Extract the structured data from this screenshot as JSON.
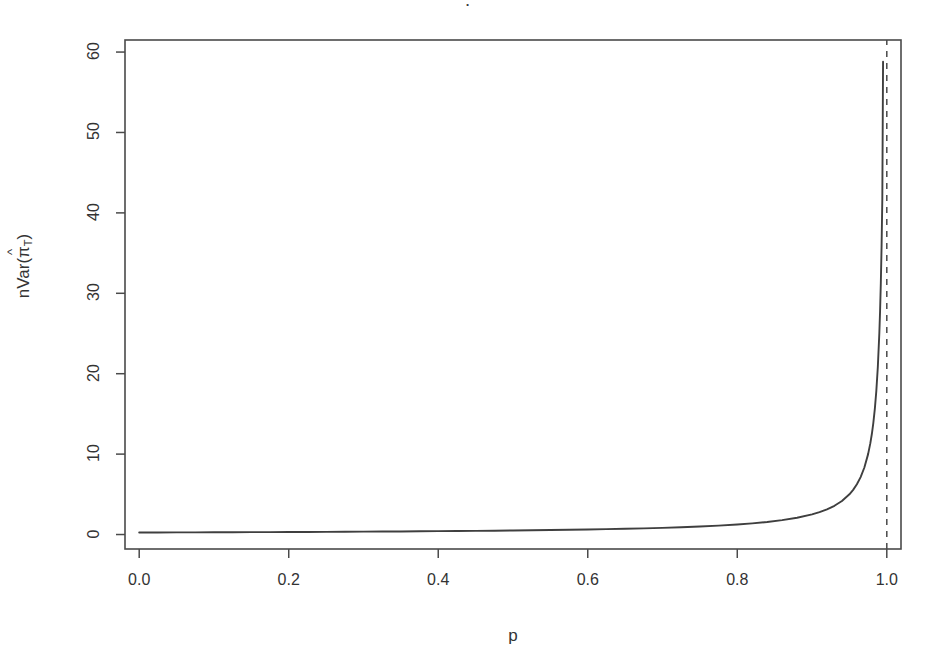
{
  "figure": {
    "title_remnant": "·",
    "background": "#ffffff",
    "line_color": "#3f3f3f",
    "axis_color": "#4a4a4a"
  },
  "axes": {
    "x_label": "p",
    "y_label_prefix": "nVar(",
    "y_label_symbol": "π",
    "y_label_hat": "^",
    "y_label_subscript": "T",
    "y_label_suffix": ")"
  },
  "chart_data": {
    "type": "line",
    "title": "",
    "xlabel": "p",
    "ylabel": "nVar(pi-hat_T)",
    "xlim": [
      -0.019,
      1.019
    ],
    "ylim": [
      -1.8,
      61.5
    ],
    "xticks": [
      0.0,
      0.2,
      0.4,
      0.6,
      0.8,
      1.0
    ],
    "xticklabels": [
      "0.0",
      "0.2",
      "0.4",
      "0.6",
      "0.8",
      "1.0"
    ],
    "yticks": [
      0,
      10,
      20,
      30,
      40,
      50,
      60
    ],
    "yticklabels": [
      "0",
      "10",
      "20",
      "30",
      "40",
      "50",
      "60"
    ],
    "grid": false,
    "legend": null,
    "box": true,
    "series": [
      {
        "name": "nVar(pi-hat_T)",
        "style": "solid",
        "x": [
          0.0,
          0.025,
          0.05,
          0.075,
          0.1,
          0.125,
          0.15,
          0.175,
          0.2,
          0.225,
          0.25,
          0.275,
          0.3,
          0.325,
          0.35,
          0.375,
          0.4,
          0.425,
          0.45,
          0.475,
          0.5,
          0.525,
          0.55,
          0.575,
          0.6,
          0.625,
          0.65,
          0.675,
          0.7,
          0.725,
          0.75,
          0.775,
          0.8,
          0.82,
          0.84,
          0.86,
          0.88,
          0.9,
          0.91,
          0.92,
          0.93,
          0.94,
          0.95,
          0.955,
          0.96,
          0.965,
          0.97,
          0.975,
          0.978,
          0.98,
          0.982,
          0.984,
          0.986,
          0.988,
          0.99,
          0.991,
          0.992,
          0.993,
          0.994,
          0.995
        ],
        "y": [
          0.25,
          0.256,
          0.263,
          0.27,
          0.278,
          0.286,
          0.294,
          0.303,
          0.313,
          0.323,
          0.333,
          0.345,
          0.357,
          0.37,
          0.385,
          0.4,
          0.417,
          0.435,
          0.455,
          0.476,
          0.5,
          0.526,
          0.556,
          0.588,
          0.625,
          0.667,
          0.714,
          0.769,
          0.833,
          0.909,
          1.0,
          1.111,
          1.25,
          1.389,
          1.563,
          1.786,
          2.083,
          2.5,
          2.778,
          3.125,
          3.571,
          4.167,
          5.0,
          5.556,
          6.25,
          7.143,
          8.333,
          10.0,
          11.364,
          12.5,
          13.889,
          15.625,
          17.857,
          20.833,
          25.0,
          27.778,
          31.25,
          35.714,
          41.667,
          58.8
        ]
      },
      {
        "name": "asymptote p = 1",
        "style": "dashed",
        "x": [
          1.0,
          1.0
        ],
        "y": [
          -1.8,
          61.5
        ]
      }
    ]
  }
}
